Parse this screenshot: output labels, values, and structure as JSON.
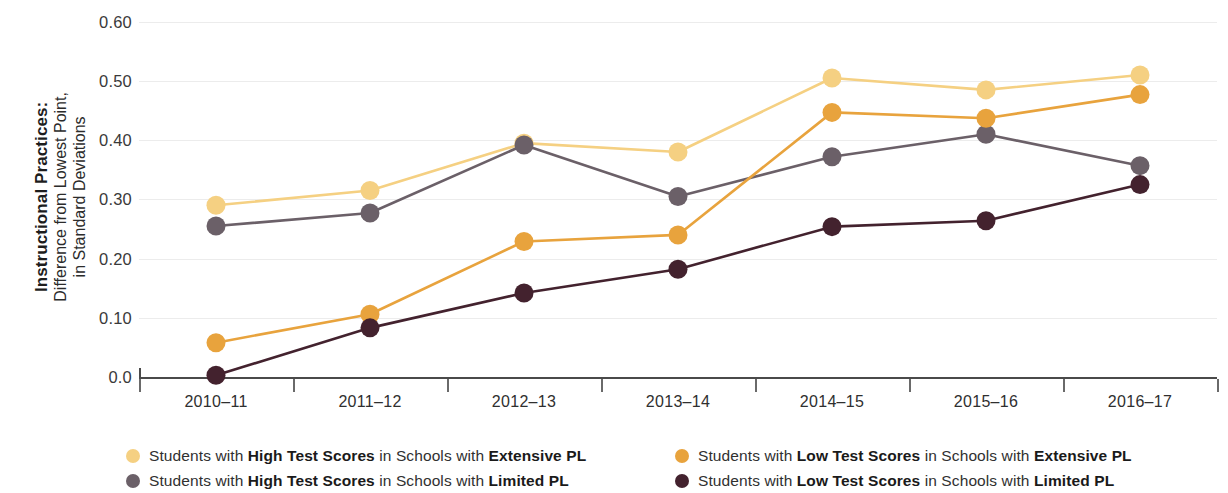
{
  "axis": {
    "y_title_bold": "Instructional Practices:",
    "y_title_regular": "Difference from Lowest Point, in Standard Deviations",
    "y_title_regular_line1": "Difference from Lowest Point,",
    "y_title_regular_line2": "in Standard Deviations"
  },
  "legend": {
    "items": [
      {
        "color": "#F5D082",
        "prefix": "Students with ",
        "bold1": "High Test Scores",
        "middle": " in Schools with ",
        "bold2": "Extensive PL",
        "full": "Students with High Test Scores in Schools with Extensive PL"
      },
      {
        "color": "#6B6068",
        "prefix": "Students with ",
        "bold1": "High Test Scores",
        "middle": " in Schools with ",
        "bold2": "Limited PL",
        "full": "Students with High Test Scores in Schools with Limited PL"
      },
      {
        "color": "#E8A33D",
        "prefix": "Students with ",
        "bold1": "Low Test Scores",
        "middle": " in Schools with ",
        "bold2": "Extensive PL",
        "full": "Students with Low Test Scores in Schools with Extensive PL"
      },
      {
        "color": "#43222E",
        "prefix": "Students with ",
        "bold1": "Low Test Scores",
        "middle": " in Schools with ",
        "bold2": "Limited PL",
        "full": "Students with Low Test Scores in Schools with Limited PL"
      }
    ]
  },
  "chart_data": {
    "type": "line",
    "title": "",
    "xlabel": "",
    "ylabel": "Instructional Practices: Difference from Lowest Point, in Standard Deviations",
    "ylim": [
      0.0,
      0.6
    ],
    "ytick_labels": [
      "0.60",
      "0.50",
      "0.40",
      "0.30",
      "0.20",
      "0.10",
      "0.0"
    ],
    "ytick_values": [
      0.6,
      0.5,
      0.4,
      0.3,
      0.2,
      0.1,
      0.0
    ],
    "grid": true,
    "legend_position": "bottom",
    "categories": [
      "2010–11",
      "2011–12",
      "2012–13",
      "2013–14",
      "2014–15",
      "2015–16",
      "2016–17"
    ],
    "series": [
      {
        "name": "Students with High Test Scores in Schools with Extensive PL",
        "color": "#F5D082",
        "values": [
          0.29,
          0.315,
          0.395,
          0.38,
          0.505,
          0.485,
          0.51
        ]
      },
      {
        "name": "Students with High Test Scores in Schools with Limited PL",
        "color": "#6B6068",
        "values": [
          0.255,
          0.277,
          0.392,
          0.305,
          0.372,
          0.41,
          0.357
        ]
      },
      {
        "name": "Students with Low Test Scores in Schools with Extensive PL",
        "color": "#E8A33D",
        "values": [
          0.058,
          0.106,
          0.229,
          0.24,
          0.447,
          0.437,
          0.477
        ]
      },
      {
        "name": "Students with Low Test Scores in Schools with Limited PL",
        "color": "#43222E",
        "values": [
          0.003,
          0.083,
          0.142,
          0.182,
          0.254,
          0.264,
          0.325
        ]
      }
    ]
  }
}
